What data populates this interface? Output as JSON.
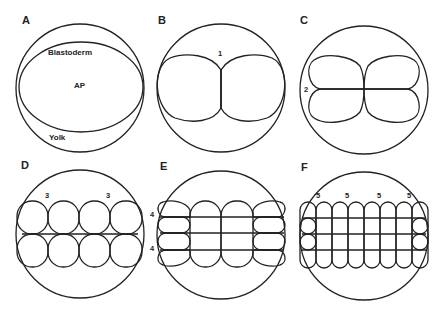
{
  "figure": {
    "panels": [
      {
        "id": "A",
        "label": "A",
        "annotations": {
          "blastoderm": "Blastoderm",
          "animal_pole": "AP",
          "yolk": "Yolk"
        },
        "cells": {
          "cols": 1,
          "rows": 1
        }
      },
      {
        "id": "B",
        "label": "B",
        "cleavage_marks": [
          "1"
        ],
        "cells": {
          "cols": 2,
          "rows": 1
        }
      },
      {
        "id": "C",
        "label": "C",
        "cleavage_marks": [
          "2"
        ],
        "cells": {
          "cols": 2,
          "rows": 2
        }
      },
      {
        "id": "D",
        "label": "D",
        "cleavage_marks": [
          "3",
          "3"
        ],
        "cells": {
          "cols": 4,
          "rows": 2
        }
      },
      {
        "id": "E",
        "label": "E",
        "cleavage_marks": [
          "4",
          "4"
        ],
        "cells": {
          "cols": 4,
          "rows": 4
        }
      },
      {
        "id": "F",
        "label": "F",
        "cleavage_marks": [
          "5",
          "5",
          "5",
          "5"
        ],
        "cells": {
          "cols": 8,
          "rows": 4
        }
      }
    ]
  }
}
